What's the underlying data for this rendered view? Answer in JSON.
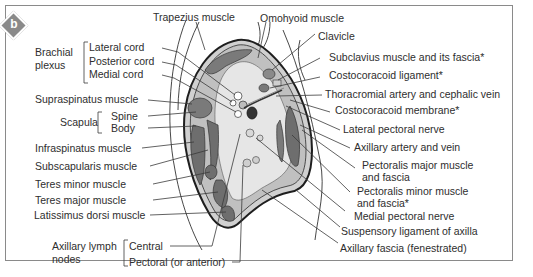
{
  "figure": {
    "panel_letter": "b",
    "badge_color": "#8a8a8a"
  },
  "labels": {
    "left": {
      "brachial_plexus": {
        "group": [
          "Brachial",
          "plexus"
        ],
        "items": [
          "Lateral cord",
          "Posterior cord",
          "Medial cord"
        ]
      },
      "supraspinatus": "Supraspinatus muscle",
      "scapula": {
        "group": "Scapula",
        "items": [
          "Spine",
          "Body"
        ]
      },
      "infraspinatus": "Infraspinatus muscle",
      "subscapularis": "Subscapularis muscle",
      "teres_minor": "Teres minor muscle",
      "teres_major": "Teres major muscle",
      "latissimus": "Latissimus dorsi muscle",
      "lymph_nodes": {
        "group": [
          "Axillary lymph",
          "nodes"
        ],
        "items": [
          "Central",
          "Pectoral (or anterior)"
        ]
      }
    },
    "top": {
      "trapezius": "Trapezius muscle",
      "omohyoid": "Omohyoid muscle"
    },
    "right": {
      "clavicle": "Clavicle",
      "subclavius": "Subclavius muscle and its fascia*",
      "costocoracoid_ligament": "Costocoracoid ligament*",
      "thoracromial": "Thoracromial artery and cephalic vein",
      "costocoracoid_membrane": "Costocoracoid membrane*",
      "lateral_pectoral_nerve": "Lateral pectoral nerve",
      "axillary_artery_vein": "Axillary artery and vein",
      "pectoralis_major": [
        "Pectoralis major muscle",
        "and fascia"
      ],
      "pectoralis_minor": [
        "Pectoralis minor muscle",
        "and fascia*"
      ],
      "medial_pectoral_nerve": "Medial pectoral nerve",
      "suspensory_ligament": "Suspensory ligament of axilla",
      "axillary_fascia": "Axillary fascia (fenestrated)"
    }
  },
  "colors": {
    "muscle": "#7a7a7a",
    "muscle_dark": "#5e5e5e",
    "fascia_fill": "#c8c8c8",
    "cavity": "#e2e2e2",
    "outline": "#1e1e1e",
    "leader": "#3a3a3a"
  }
}
